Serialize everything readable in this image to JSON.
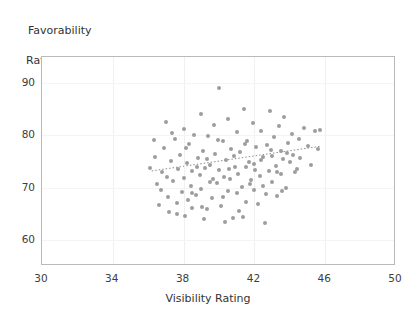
{
  "chart_data": {
    "type": "scatter",
    "title": "",
    "xlabel": "Visibility Rating",
    "ylabel": "Favorability\nRating",
    "ylabel_line1": "Favorability",
    "ylabel_line2": "Rating",
    "xlim": [
      30,
      50
    ],
    "ylim": [
      55,
      95
    ],
    "xticks": [
      30,
      34,
      38,
      42,
      46,
      50
    ],
    "yticks": [
      60,
      70,
      80,
      90
    ],
    "grid": true,
    "legend": null,
    "marker_color": "#9d9d9d",
    "trendline_color": "#8d8d8d",
    "trendline": {
      "style": "dotted",
      "x": [
        36.2,
        45.7
      ],
      "y": [
        73.2,
        77.9
      ]
    },
    "points": [
      [
        36.1,
        73.8
      ],
      [
        36.3,
        79.2
      ],
      [
        36.5,
        70.6
      ],
      [
        36.6,
        66.7
      ],
      [
        36.8,
        73.0
      ],
      [
        36.9,
        77.6
      ],
      [
        37.0,
        82.6
      ],
      [
        37.1,
        68.2
      ],
      [
        37.2,
        65.4
      ],
      [
        37.3,
        75.1
      ],
      [
        37.4,
        71.3
      ],
      [
        37.5,
        79.4
      ],
      [
        37.6,
        67.0
      ],
      [
        37.7,
        73.5
      ],
      [
        37.8,
        76.2
      ],
      [
        37.9,
        69.1
      ],
      [
        38.0,
        81.2
      ],
      [
        38.0,
        71.9
      ],
      [
        38.1,
        64.6
      ],
      [
        38.2,
        74.8
      ],
      [
        38.3,
        78.3
      ],
      [
        38.4,
        70.3
      ],
      [
        38.5,
        66.1
      ],
      [
        38.5,
        73.2
      ],
      [
        38.6,
        80.1
      ],
      [
        38.7,
        68.6
      ],
      [
        38.8,
        75.6
      ],
      [
        38.9,
        72.4
      ],
      [
        39.0,
        84.0
      ],
      [
        39.0,
        69.8
      ],
      [
        39.1,
        77.0
      ],
      [
        39.2,
        73.7
      ],
      [
        39.3,
        65.9
      ],
      [
        39.4,
        79.8
      ],
      [
        39.5,
        71.1
      ],
      [
        39.5,
        74.4
      ],
      [
        39.6,
        68.0
      ],
      [
        39.7,
        82.0
      ],
      [
        39.8,
        76.5
      ],
      [
        39.9,
        70.8
      ],
      [
        40.0,
        89.0
      ],
      [
        40.0,
        73.3
      ],
      [
        40.1,
        66.4
      ],
      [
        40.2,
        78.9
      ],
      [
        40.3,
        72.0
      ],
      [
        40.4,
        75.3
      ],
      [
        40.5,
        69.3
      ],
      [
        40.5,
        83.1
      ],
      [
        40.6,
        71.6
      ],
      [
        40.7,
        77.3
      ],
      [
        40.8,
        64.1
      ],
      [
        40.9,
        74.0
      ],
      [
        41.0,
        80.6
      ],
      [
        41.0,
        68.9
      ],
      [
        41.1,
        72.7
      ],
      [
        41.2,
        76.8
      ],
      [
        41.3,
        70.1
      ],
      [
        41.4,
        85.0
      ],
      [
        41.5,
        73.9
      ],
      [
        41.5,
        67.3
      ],
      [
        41.6,
        79.0
      ],
      [
        41.7,
        75.0
      ],
      [
        41.8,
        71.4
      ],
      [
        41.9,
        82.3
      ],
      [
        42.0,
        69.6
      ],
      [
        42.0,
        74.6
      ],
      [
        42.1,
        77.8
      ],
      [
        42.2,
        66.8
      ],
      [
        42.3,
        72.2
      ],
      [
        42.4,
        80.9
      ],
      [
        42.5,
        75.8
      ],
      [
        42.5,
        70.4
      ],
      [
        42.6,
        63.3
      ],
      [
        42.7,
        78.1
      ],
      [
        42.8,
        73.1
      ],
      [
        42.9,
        84.6
      ],
      [
        43.0,
        76.0
      ],
      [
        43.0,
        71.0
      ],
      [
        43.1,
        79.6
      ],
      [
        43.2,
        74.2
      ],
      [
        43.3,
        68.4
      ],
      [
        43.4,
        81.7
      ],
      [
        43.5,
        77.1
      ],
      [
        43.5,
        72.6
      ],
      [
        43.6,
        75.4
      ],
      [
        43.7,
        83.6
      ],
      [
        43.8,
        70.0
      ],
      [
        43.9,
        78.6
      ],
      [
        44.0,
        74.9
      ],
      [
        44.1,
        80.3
      ],
      [
        44.2,
        76.3
      ],
      [
        44.3,
        72.9
      ],
      [
        44.5,
        79.3
      ],
      [
        44.6,
        75.7
      ],
      [
        44.8,
        81.5
      ],
      [
        45.0,
        78.0
      ],
      [
        45.2,
        74.3
      ],
      [
        45.4,
        80.8
      ],
      [
        45.6,
        77.4
      ],
      [
        45.7,
        81.0
      ],
      [
        36.4,
        75.9
      ],
      [
        36.7,
        69.5
      ],
      [
        37.05,
        72.1
      ],
      [
        37.35,
        80.4
      ],
      [
        37.65,
        65.0
      ],
      [
        38.15,
        77.5
      ],
      [
        38.45,
        69.0
      ],
      [
        38.75,
        73.9
      ],
      [
        39.05,
        66.2
      ],
      [
        39.35,
        75.5
      ],
      [
        39.65,
        71.7
      ],
      [
        39.95,
        79.1
      ],
      [
        40.25,
        68.3
      ],
      [
        40.55,
        73.6
      ],
      [
        40.85,
        76.1
      ],
      [
        41.15,
        65.6
      ],
      [
        41.45,
        78.4
      ],
      [
        41.75,
        70.7
      ],
      [
        42.05,
        73.4
      ],
      [
        42.35,
        75.2
      ],
      [
        42.65,
        68.8
      ],
      [
        42.95,
        77.2
      ],
      [
        43.25,
        73.0
      ],
      [
        43.55,
        69.4
      ],
      [
        43.85,
        76.6
      ],
      [
        40.35,
        63.5
      ],
      [
        41.35,
        64.3
      ],
      [
        39.15,
        63.9
      ],
      [
        38.25,
        67.6
      ],
      [
        44.4,
        73.5
      ]
    ]
  },
  "frame": {
    "plot_left": 41,
    "plot_top": 56,
    "plot_width": 354,
    "plot_height": 209,
    "border_color": "#b9b9b9"
  }
}
